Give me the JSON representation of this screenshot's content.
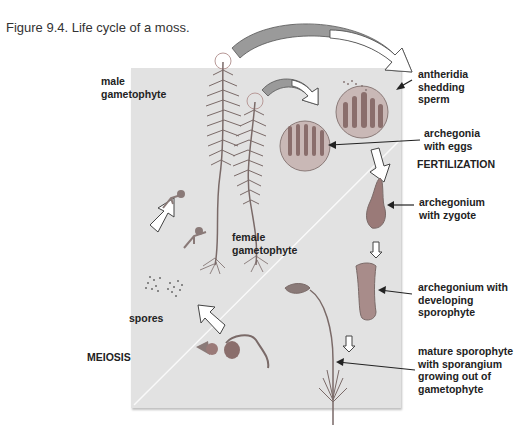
{
  "figure": {
    "caption": "Figure 9.4.  Life cycle of a moss."
  },
  "labels": {
    "male_gametophyte": [
      "male",
      "gametophyte"
    ],
    "female_gametophyte": [
      "female",
      "gametophyte"
    ],
    "antheridia": [
      "antheridia",
      "shedding",
      "sperm"
    ],
    "archegonia": [
      "archegonia",
      "with eggs"
    ],
    "archegonium_zygote": [
      "archegonium",
      "with zygote"
    ],
    "archegonium_developing": [
      "archegonium with",
      "developing",
      "sporophyte"
    ],
    "mature_sporophyte": [
      "mature sporophyte",
      "with sporangium",
      "growing out of",
      "gametophyte"
    ],
    "spores": "spores"
  },
  "stages": {
    "fertilization": "FERTILIZATION",
    "meiosis": "MEIOSIS"
  },
  "colors": {
    "panel": "#e2e2e2",
    "plant": "#7a6a68",
    "arrow_fill": "#9a9a9a",
    "text": "#222222"
  }
}
